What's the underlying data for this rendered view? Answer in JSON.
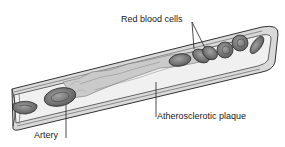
{
  "diagram": {
    "labels": {
      "red_blood_cells": "Red blood cells",
      "plaque": "Atherosclerotic plaque",
      "artery": "Artery"
    },
    "colors": {
      "background": "#ffffff",
      "wall_fill": "#d6d6d6",
      "wall_stroke": "#3a3a3a",
      "lumen_fill": "#efefef",
      "plaque_fill": "#c9c9c9",
      "cell_fill": "#7a7a7a",
      "cell_stroke": "#2e2e2e",
      "text": "#1a1a1a"
    }
  }
}
